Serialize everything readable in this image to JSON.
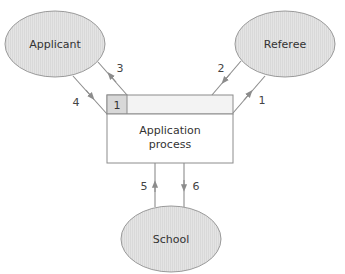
{
  "diagram": {
    "nodes": {
      "applicant": {
        "label": "Applicant"
      },
      "referee": {
        "label": "Referee"
      },
      "school": {
        "label": "School"
      }
    },
    "process_box": {
      "line1": "Application",
      "line2": "process",
      "tab_label": "1"
    },
    "arrows": [
      {
        "id": "1",
        "label": "1",
        "from": "Application process",
        "to": "Referee"
      },
      {
        "id": "2",
        "label": "2",
        "from": "Referee",
        "to": "Application process"
      },
      {
        "id": "3",
        "label": "3",
        "from": "Application process",
        "to": "Applicant"
      },
      {
        "id": "4",
        "label": "4",
        "from": "Applicant",
        "to": "Application process"
      },
      {
        "id": "5",
        "label": "5",
        "from": "School",
        "to": "Application process"
      },
      {
        "id": "6",
        "label": "6",
        "from": "Application process",
        "to": "School"
      }
    ],
    "colors": {
      "ellipse_fill": "#e2e2e2",
      "ellipse_stroke": "#999999",
      "tab_fill": "#dcdcdc",
      "strip_fill": "#f2f2f2",
      "line": "#8c8c8c",
      "text": "#333333"
    }
  }
}
